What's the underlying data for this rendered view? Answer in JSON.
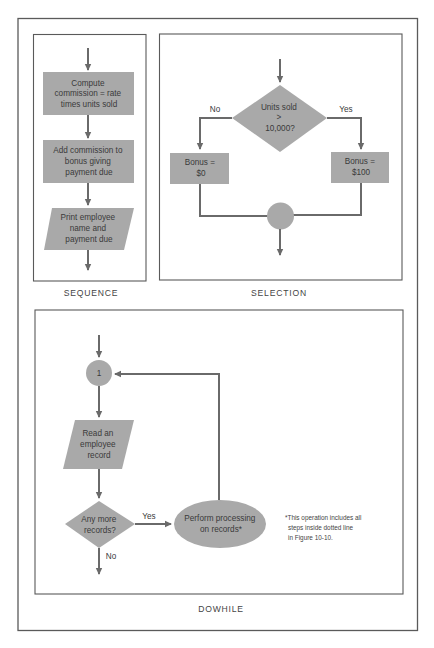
{
  "figure": {
    "colors": {
      "shape_fill": "#a9a9a9",
      "line": "#6a6a6a",
      "frame": "#5a5a5a",
      "text": "#3a3a3a",
      "background": "#ffffff"
    },
    "panels": {
      "sequence": {
        "caption": "SEQUENCE",
        "steps": [
          {
            "shape": "process",
            "lines": [
              "Compute",
              "commission = rate",
              "times units sold"
            ]
          },
          {
            "shape": "process",
            "lines": [
              "Add commission to",
              "bonus giving",
              "payment due"
            ]
          },
          {
            "shape": "input-output",
            "lines": [
              "Print employee",
              "name and",
              "payment due"
            ]
          }
        ]
      },
      "selection": {
        "caption": "SELECTION",
        "decision": {
          "lines": [
            "Units sold",
            ">",
            "10,000?"
          ]
        },
        "no_label": "No",
        "yes_label": "Yes",
        "no_branch": {
          "lines": [
            "Bonus =",
            "$0"
          ]
        },
        "yes_branch": {
          "lines": [
            "Bonus =",
            "$100"
          ]
        }
      },
      "dowhile": {
        "caption": "DOWHILE",
        "connector": {
          "label": "1"
        },
        "read_step": {
          "lines": [
            "Read an",
            "employee",
            "record"
          ]
        },
        "decision": {
          "lines": [
            "Any more",
            "records?"
          ]
        },
        "yes_label": "Yes",
        "no_label": "No",
        "process": {
          "lines": [
            "Perform processing",
            "on records*"
          ]
        },
        "footnote": [
          "*This operation includes all",
          "steps inside dotted line",
          "in Figure 10-10."
        ]
      }
    }
  }
}
